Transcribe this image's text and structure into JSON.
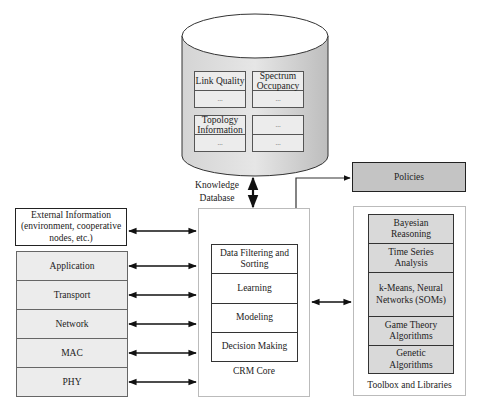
{
  "database": {
    "label_line1": "Knowledge",
    "label_line2": "Database",
    "cells": [
      {
        "header": "Link Quality",
        "body": "..."
      },
      {
        "header": "Spectrum Occupancy",
        "body": "..."
      },
      {
        "header": "Topology Information",
        "body": "..."
      },
      {
        "header": "...",
        "body": "..."
      }
    ]
  },
  "policies": {
    "label": "Policies"
  },
  "external_info": {
    "line1": "External Information",
    "line2": "(environment, cooperative",
    "line3": "nodes, etc.)"
  },
  "protocol_layers": [
    "Application",
    "Transport",
    "Network",
    "MAC",
    "PHY"
  ],
  "crm_core": {
    "caption": "CRM Core",
    "components": [
      "Data Filtering and Sorting",
      "Learning",
      "Modeling",
      "Decision Making"
    ]
  },
  "toolbox": {
    "caption": "Toolbox and Libraries",
    "items": [
      "Bayesian Reasoning",
      "Time Series Analysis",
      "k-Means, Neural Networks (SOMs)",
      "Game Theory Algorithms",
      "Genetic Algorithms"
    ]
  },
  "colors": {
    "cylinder_fill": "#c8c8c8",
    "cylinder_top": "#ffffff",
    "layer_fill": "#ececec",
    "toolbox_fill": "#d9d9d9",
    "policies_fill": "#c4c4c4",
    "line": "#222222"
  }
}
